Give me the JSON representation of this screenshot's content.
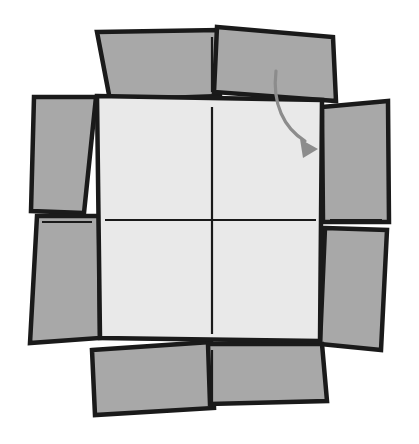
{
  "figure": {
    "title": "Open cardboard box with unfolded flaps",
    "background_color": "#ffffff",
    "canvas": {
      "width": 419,
      "height": 444
    }
  },
  "colors": {
    "flap_fill": "#a8a8a8",
    "panel_fill": "#e9e9e9",
    "outline": "#1a1a1a",
    "crease": "#1a1a1a",
    "arrow": "#8c8c8c"
  },
  "stroke_widths": {
    "outline": 4.5,
    "crease": 2.2,
    "arrow_shaft": 3.2
  },
  "base_panel": {
    "name": "box-base-panel",
    "fill": "#e9e9e9",
    "points": "97,96 322,100 320,341 100,338"
  },
  "flaps": [
    {
      "name": "flap-top-left",
      "label": "top-left-flap",
      "fill": "#a8a8a8",
      "points": "97,32 219,30 220,96 110,100"
    },
    {
      "name": "flap-top-right",
      "label": "top-right-flap",
      "fill": "#a8a8a8",
      "points": "217,27 333,37 336,101 214,92"
    },
    {
      "name": "flap-left-upper",
      "label": "left-upper-flap",
      "fill": "#a8a8a8",
      "points": "34,97 96,97 84,213 31,211"
    },
    {
      "name": "flap-left-lower",
      "label": "left-lower-flap",
      "fill": "#a8a8a8",
      "points": "37,216 99,216 100,338 30,343"
    },
    {
      "name": "flap-right-upper",
      "label": "right-upper-flap",
      "fill": "#a8a8a8",
      "points": "322,107 388,101 389,222 323,222"
    },
    {
      "name": "flap-right-lower",
      "label": "right-lower-flap",
      "fill": "#a8a8a8",
      "points": "325,228 387,230 381,350 320,344"
    },
    {
      "name": "flap-bottom-left",
      "label": "bottom-left-flap",
      "fill": "#a8a8a8",
      "points": "92,350 211,342 214,408 95,415"
    },
    {
      "name": "flap-bottom-right",
      "label": "bottom-right-flap",
      "fill": "#a8a8a8",
      "points": "208,344 322,344 327,401 210,404"
    }
  ],
  "creases": [
    {
      "name": "crease-vertical-center",
      "x1": 212,
      "y1": 107,
      "x2": 212,
      "y2": 334
    },
    {
      "name": "crease-horizontal-center",
      "x1": 105,
      "y1": 220,
      "x2": 316,
      "y2": 220
    },
    {
      "name": "crease-vertical-top-flap",
      "x1": 212,
      "y1": 37,
      "x2": 212,
      "y2": 92
    },
    {
      "name": "crease-vertical-bottom-flap",
      "x1": 212,
      "y1": 350,
      "x2": 212,
      "y2": 404
    },
    {
      "name": "crease-horizontal-left-flap",
      "x1": 42,
      "y1": 222,
      "x2": 92,
      "y2": 222
    },
    {
      "name": "crease-horizontal-right-flap",
      "x1": 330,
      "y1": 220,
      "x2": 382,
      "y2": 220
    }
  ],
  "arrow": {
    "name": "fold-direction-arrow",
    "color": "#8c8c8c",
    "shaft_path": "M 276,71 C 272,104 284,128 305,141",
    "head_points": "318,149 300,139 303,158"
  }
}
